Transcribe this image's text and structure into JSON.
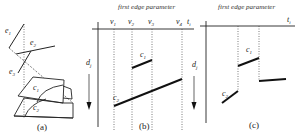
{
  "panel_a": {
    "caption": "(a)",
    "edge_labels": [
      "e1",
      "e2",
      "e3"
    ],
    "surface_labels": [
      "c1",
      "c2"
    ]
  },
  "panel_b": {
    "caption": "(b)",
    "header": "first edge parameter",
    "axis_x_label": "ti",
    "axis_y_label": "dj",
    "vertex_labels": [
      "v1",
      "v2",
      "v3",
      "v4"
    ],
    "curve_labels": [
      "c1",
      "c2"
    ]
  },
  "panel_c": {
    "caption": "(c)",
    "header": "first edge parameter",
    "axis_x_label": "ti",
    "curve_labels": [
      "c1",
      "c2"
    ]
  }
}
